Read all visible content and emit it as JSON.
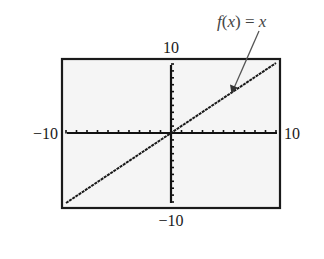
{
  "chart_data": {
    "type": "line",
    "title": "",
    "function_label": "f(x) = x",
    "series": [
      {
        "name": "f(x) = x",
        "x": [
          -10,
          10
        ],
        "values": [
          -10,
          10
        ]
      }
    ],
    "xlabel": "",
    "ylabel": "",
    "xlim": [
      -10,
      10
    ],
    "ylim": [
      -10,
      10
    ],
    "xscale": 1,
    "yscale": 1,
    "tick_labels": {
      "xmin": "−10",
      "xmax": "10",
      "ymin": "−10",
      "ymax": "10"
    },
    "grid": false,
    "legend": "none",
    "annotation": {
      "text": "f(x) = x",
      "arrow_to": [
        6,
        6
      ]
    }
  },
  "labels": {
    "ymax": "10",
    "ymin": "−10",
    "xmin": "−10",
    "xmax": "10",
    "annotation_f": "f",
    "annotation_open": "(",
    "annotation_x": "x",
    "annotation_close": ")",
    "annotation_eq": " = ",
    "annotation_rhs": "x"
  },
  "colors": {
    "frame": "#1a1a1a",
    "axes": "#111111",
    "line": "#1a1a1a",
    "plot_bg": "#f5f5f5",
    "arrow": "#555555"
  }
}
